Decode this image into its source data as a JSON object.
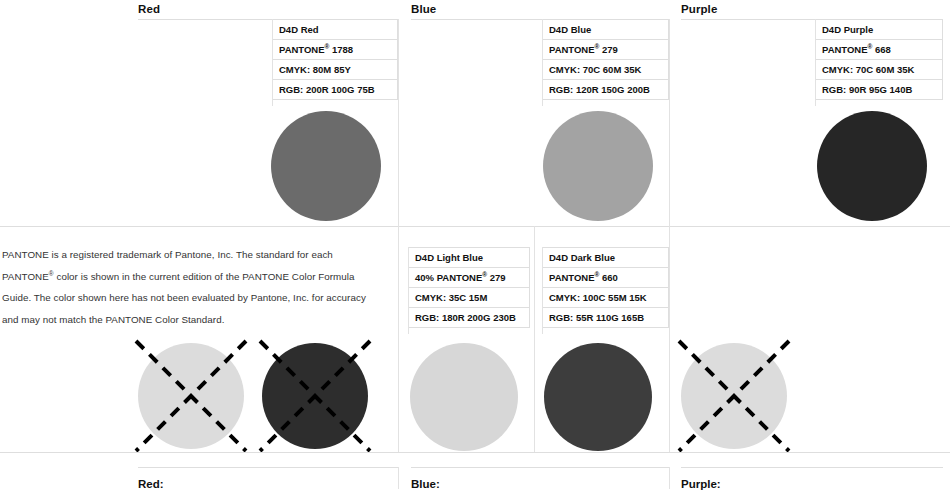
{
  "document": {
    "title": "D4D Brand Color Specifications"
  },
  "sections": {
    "red": {
      "header": "Red",
      "bottom_label": "Red:"
    },
    "blue": {
      "header": "Blue",
      "bottom_label": "Blue:"
    },
    "purple": {
      "header": "Purple",
      "bottom_label": "Purple:"
    }
  },
  "swatches": {
    "red": {
      "name": "D4D Red",
      "pantone_prefix": "PANTONE",
      "pantone_reg": "®",
      "pantone_number": "1788",
      "pantone_full": "PANTONE® 1788",
      "cmyk": "CMYK: 80M  85Y",
      "rgb": "RGB: 200R  100G  75B",
      "rgb_values": {
        "r": 200,
        "g": 100,
        "b": 75
      },
      "cmyk_values": {
        "c": 0,
        "m": 80,
        "y": 85,
        "k": 0
      },
      "render_color": "#6b6b6b"
    },
    "blue": {
      "name": "D4D Blue",
      "pantone_prefix": "PANTONE",
      "pantone_reg": "®",
      "pantone_number": "279",
      "pantone_full": "PANTONE® 279",
      "cmyk": "CMYK: 70C  60M  35K",
      "rgb": "RGB: 120R  150G  200B",
      "rgb_values": {
        "r": 120,
        "g": 150,
        "b": 200
      },
      "cmyk_values": {
        "c": 70,
        "m": 60,
        "y": 0,
        "k": 35
      },
      "render_color": "#a3a3a3"
    },
    "purple": {
      "name": "D4D Purple",
      "pantone_prefix": "PANTONE",
      "pantone_reg": "®",
      "pantone_number": "668",
      "pantone_full": "PANTONE® 668",
      "cmyk": "CMYK: 70C  60M  35K",
      "rgb": "RGB: 90R  95G  140B",
      "rgb_values": {
        "r": 90,
        "g": 95,
        "b": 140
      },
      "cmyk_values": {
        "c": 70,
        "m": 60,
        "y": 0,
        "k": 35
      },
      "render_color": "#262626"
    },
    "light_blue": {
      "name": "D4D Light Blue",
      "pantone_prefix": "40% PANTONE",
      "pantone_reg": "®",
      "pantone_number": "279",
      "pantone_full": "40% PANTONE® 279",
      "cmyk": "CMYK: 35C  15M",
      "rgb": "RGB: 180R  200G  230B",
      "rgb_values": {
        "r": 180,
        "g": 200,
        "b": 230
      },
      "cmyk_values": {
        "c": 35,
        "m": 15,
        "y": 0,
        "k": 0
      },
      "render_color": "#d7d7d7"
    },
    "dark_blue": {
      "name": "D4D Dark Blue",
      "pantone_prefix": "PANTONE",
      "pantone_reg": "®",
      "pantone_number": "660",
      "pantone_full": "PANTONE® 660",
      "cmyk": "CMYK: 100C  55M  15K",
      "rgb": "RGB: 55R  110G  165B",
      "rgb_values": {
        "r": 55,
        "g": 110,
        "b": 165
      },
      "cmyk_values": {
        "c": 100,
        "m": 55,
        "y": 0,
        "k": 15
      },
      "render_color": "#3d3d3d"
    },
    "crossed_light": {
      "render_color": "#dcdcdc"
    },
    "crossed_dark": {
      "render_color": "#2d2d2d"
    },
    "crossed_light_right": {
      "render_color": "#dcdcdc"
    }
  },
  "legal": {
    "line1": "PANTONE is a registered trademark of Pantone, Inc. The standard for each PANTONE",
    "reg": "®",
    "line2": "color is shown in the current edition of the PANTONE Color Formula Guide. The color",
    "line3": "shown here has not been evaluated by Pantone, Inc. for accuracy and may not match",
    "line4": "the PANTONE Color Standard.",
    "full": "PANTONE is a registered trademark of Pantone, Inc. The standard for each PANTONE® color is shown in the current edition of the PANTONE Color Formula Guide. The color shown here has not been evaluated by Pantone, Inc. for accuracy and may not match the PANTONE Color Standard."
  },
  "colors": {
    "rule": "#dedede",
    "text": "#111111",
    "body_text": "#333333",
    "background": "#ffffff"
  }
}
